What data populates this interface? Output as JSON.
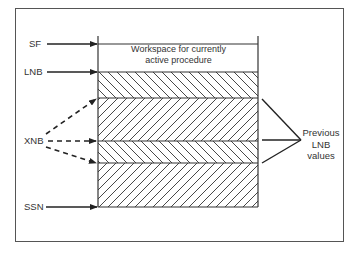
{
  "diagram": {
    "workspace_label_line1": "Workspace for currently",
    "workspace_label_line2": "active procedure",
    "pointers": {
      "sf": "SF",
      "lnb": "LNB",
      "xnb": "XNB",
      "ssn": "SSN"
    },
    "previous_label": {
      "line1": "Previous",
      "line2": "LNB",
      "line3": "values"
    },
    "colors": {
      "line": "#2a2a2a",
      "border": "#555555",
      "background": "#ffffff"
    }
  }
}
